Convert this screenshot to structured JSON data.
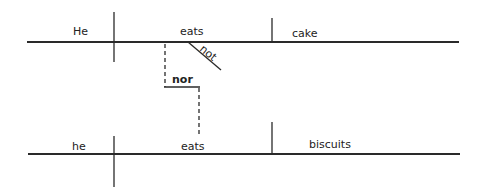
{
  "diagram": {
    "type": "sentence-diagram",
    "clause_top": {
      "subject": "He",
      "verb": "eats",
      "object": "cake",
      "modifier": "not"
    },
    "conjunction": "nor",
    "clause_bottom": {
      "subject": "he",
      "verb": "eats",
      "object": "biscuits"
    },
    "colors": {
      "line": "#2a2a2a",
      "text": "#222222",
      "background": "#ffffff"
    }
  }
}
